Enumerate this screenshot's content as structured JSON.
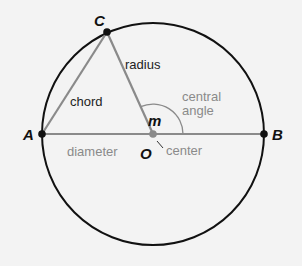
{
  "diagram": {
    "colors": {
      "background": "#f3f3f3",
      "circle": "#111111",
      "segments": "#8a8a8a",
      "points": "#111111",
      "center_point": "#8a8a8a",
      "gray_text": "#8a8a8a"
    },
    "points": {
      "A": "A",
      "B": "B",
      "C": "C",
      "O": "O"
    },
    "labels": {
      "chord": "chord",
      "radius": "radius",
      "diameter": "diameter",
      "center": "center",
      "central_angle_line1": "central",
      "central_angle_line2": "angle",
      "angle_measure": "m"
    }
  }
}
